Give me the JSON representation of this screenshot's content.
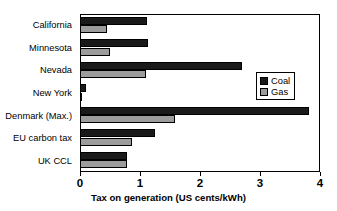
{
  "chart_data": {
    "type": "bar",
    "orientation": "horizontal",
    "title": "",
    "xlabel": "Tax on generation (US cents/kWh)",
    "ylabel": "",
    "xlim": [
      0,
      4
    ],
    "xticks": [
      0,
      1,
      2,
      3,
      4
    ],
    "xtick_labels": [
      "0",
      "1",
      "2",
      "3",
      "4"
    ],
    "grid": false,
    "legend_position": "upper right",
    "categories": [
      "California",
      "Minnesota",
      "Nevada",
      "New York",
      "Denmark (Max.)",
      "EU carbon tax",
      "UK CCL"
    ],
    "series": [
      {
        "name": "Coal",
        "color": "#1a1a1a",
        "values": [
          1.12,
          1.13,
          2.7,
          0.1,
          3.82,
          1.25,
          0.78
        ]
      },
      {
        "name": "Gas",
        "color": "#9c9c9c",
        "values": [
          0.45,
          0.5,
          1.1,
          0.03,
          1.58,
          0.86,
          0.78
        ]
      }
    ]
  },
  "legend": {
    "items": [
      {
        "label": "Coal",
        "swatch": "coal"
      },
      {
        "label": "Gas",
        "swatch": "gas"
      }
    ]
  }
}
